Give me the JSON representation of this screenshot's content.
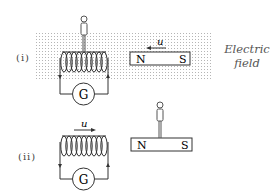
{
  "diagram": {
    "scenarios": [
      {
        "label": "(i)",
        "coil": {
          "meter_label": "G"
        },
        "magnet": {
          "north": "N",
          "south": "S",
          "velocity_label": "u",
          "velocity_direction": "left"
        },
        "observer_location": "on coil",
        "field_region": true
      },
      {
        "label": "(ii)",
        "coil": {
          "meter_label": "G",
          "velocity_label": "u",
          "velocity_direction": "right"
        },
        "magnet": {
          "north": "N",
          "south": "S"
        },
        "observer_location": "on magnet",
        "field_region": false
      }
    ],
    "field_label_line1": "Electric",
    "field_label_line2": "field",
    "colors": {
      "line": "#333333",
      "field_dots": "#b8b8b8"
    }
  }
}
